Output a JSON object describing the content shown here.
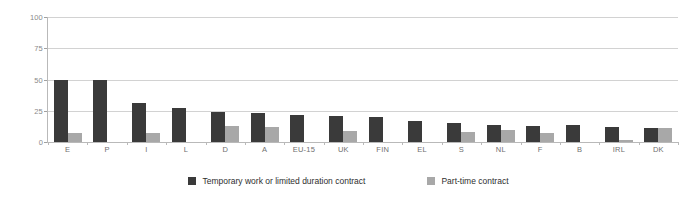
{
  "chart_data": {
    "type": "bar",
    "title": "",
    "subtitle": "",
    "xlabel": "",
    "ylabel": "",
    "ylim": [
      0,
      100
    ],
    "yticks": [
      0,
      25,
      50,
      75,
      100
    ],
    "ytick_labels": [
      "0",
      "25",
      "50",
      "75",
      "100"
    ],
    "grid": true,
    "legend_position": "bottom",
    "categories": [
      "E",
      "P",
      "I",
      "L",
      "D",
      "A",
      "EU-15",
      "UK",
      "FIN",
      "EL",
      "S",
      "NL",
      "F",
      "B",
      "IRL",
      "DK"
    ],
    "series": [
      {
        "name": "Temporary work or limited duration contract",
        "color": "#3a3a3a",
        "values": [
          50,
          50,
          31,
          27,
          24,
          23,
          22,
          21,
          20,
          17,
          15,
          14,
          13,
          14,
          12,
          11
        ]
      },
      {
        "name": "Part-time contract",
        "color": "#a8a8a8",
        "values": [
          7,
          0,
          7,
          0,
          13,
          12,
          0,
          9,
          0,
          0,
          8,
          10,
          7,
          0,
          2,
          11
        ]
      }
    ]
  },
  "legend": {
    "entries": [
      {
        "label": "Temporary work or limited duration contract"
      },
      {
        "label": "Part-time contract"
      }
    ]
  }
}
